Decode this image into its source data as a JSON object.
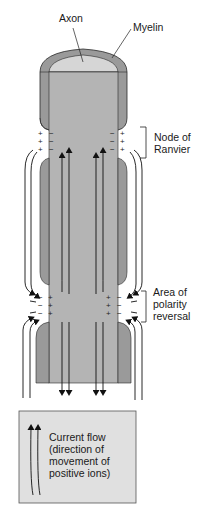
{
  "labels": {
    "axon": "Axon",
    "myelin": "Myelin",
    "node_of_ranvier": [
      "Node of",
      "Ranvier"
    ],
    "polarity_reversal": [
      "Area of",
      "polarity",
      "reversal"
    ]
  },
  "legend": {
    "lines": [
      "Current flow",
      "(direction of",
      "movement of",
      "positive ions)"
    ],
    "icon": "double-up-arrow-icon"
  },
  "node_signs": {
    "left_outer": [
      "+",
      "+",
      "+"
    ],
    "left_inner": [
      "−",
      "−",
      "−"
    ],
    "right_inner": [
      "−",
      "−",
      "−"
    ],
    "right_outer": [
      "+",
      "+",
      "+"
    ]
  },
  "reversal_signs": {
    "left_outer": [
      "−",
      "−",
      "−"
    ],
    "left_inner": [
      "+",
      "+",
      "+"
    ],
    "right_inner": [
      "+",
      "+",
      "+"
    ],
    "right_outer": [
      "−",
      "−",
      "−"
    ]
  },
  "colors": {
    "axon_fill": "#b4b4b4",
    "myelin_fill": "#9a9a9a",
    "axon_top": "#d6d6d6",
    "outline": "#2a2a2a",
    "legend_bg": "#e0e0e0"
  }
}
